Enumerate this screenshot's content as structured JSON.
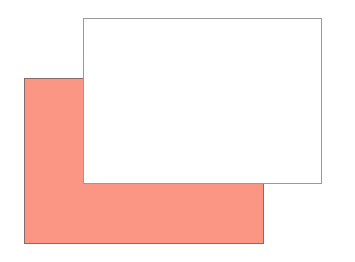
{
  "diagram": {
    "shapes": [
      {
        "id": "back",
        "fill": "#fb9684",
        "stroke": "#8a6a66",
        "x": 24,
        "y": 78,
        "width": 240,
        "height": 166
      },
      {
        "id": "front",
        "fill": "#ffffff",
        "stroke": "#9a9a9a",
        "x": 83,
        "y": 18,
        "width": 239,
        "height": 166
      }
    ]
  }
}
